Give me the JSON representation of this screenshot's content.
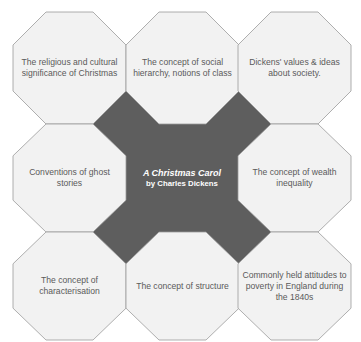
{
  "colors": {
    "octagon_fill": "#f2f2f2",
    "octagon_stroke": "#9a9a9a",
    "center_fill": "#5e5e5e",
    "text": "#5a5a5a",
    "center_text": "#ffffff"
  },
  "center": {
    "title": "A Christmas Carol",
    "subtitle": "by Charles Dickens"
  },
  "octagons": [
    {
      "position": "top-left",
      "text": "The religious and cultural significance of Christmas"
    },
    {
      "position": "top-center",
      "text": "The concept of social hierarchy, notions of class"
    },
    {
      "position": "top-right",
      "text": "Dickens' values & ideas about society."
    },
    {
      "position": "middle-left",
      "text": "Conventions of ghost stories"
    },
    {
      "position": "middle-right",
      "text": "The concept of wealth inequality"
    },
    {
      "position": "bottom-left",
      "text": "The concept of characterisation"
    },
    {
      "position": "bottom-center",
      "text": "The concept of structure"
    },
    {
      "position": "bottom-right",
      "text": "Commonly held attitudes to poverty in England during the 1840s"
    }
  ]
}
